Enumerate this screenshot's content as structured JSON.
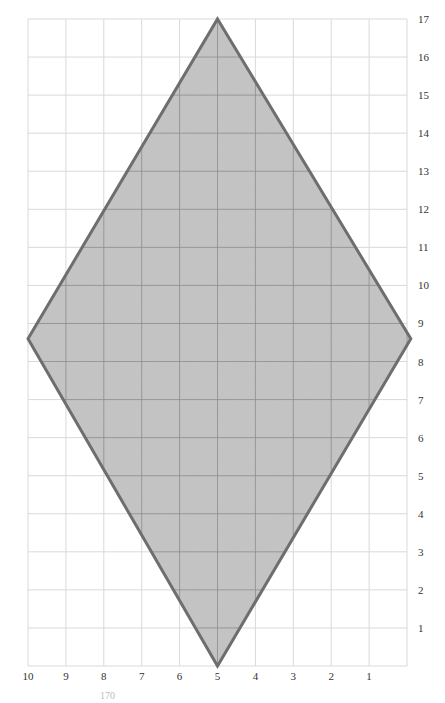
{
  "diagram": {
    "type": "grid-polygon",
    "shape": "rhombus",
    "colors": {
      "background": "#ffffff",
      "grid_outer": "#d9d9d9",
      "grid_inner": "#8c8c8c",
      "fill": "#c4c4c4",
      "stroke": "#6e6e6e",
      "labels": "#333333"
    },
    "grid": {
      "x_min": 0,
      "x_max": 10,
      "y_min": 0,
      "y_max": 17,
      "x_reversed": true
    },
    "x_labels": [
      "10",
      "9",
      "8",
      "7",
      "6",
      "5",
      "4",
      "3",
      "2",
      "1"
    ],
    "y_labels": [
      "1",
      "2",
      "3",
      "4",
      "5",
      "6",
      "7",
      "8",
      "9",
      "10",
      "11",
      "12",
      "13",
      "14",
      "15",
      "16",
      "17"
    ],
    "vertices": [
      {
        "name": "top",
        "x": 5,
        "y": 17
      },
      {
        "name": "right",
        "x": -0.1,
        "y": 8.6
      },
      {
        "name": "bottom",
        "x": 5,
        "y": 0
      },
      {
        "name": "left",
        "x": 10,
        "y": 8.6
      }
    ]
  },
  "caption": "170"
}
